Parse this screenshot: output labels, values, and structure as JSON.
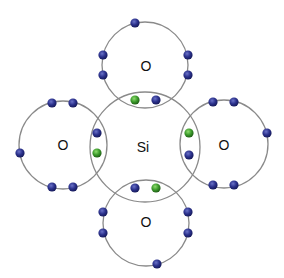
{
  "diagram": {
    "colors": {
      "shell_stroke": "#8a8a8a",
      "electron_oxygen": "#2b318c",
      "electron_silicon": "#3c9b2c",
      "background": "#ffffff"
    },
    "atoms": [
      {
        "id": "si",
        "label": "Si",
        "cx": 145,
        "cy": 147,
        "r": 55,
        "label_x": 143,
        "label_y": 147
      },
      {
        "id": "o-top",
        "label": "O",
        "cx": 145,
        "cy": 65,
        "r": 43,
        "label_x": 146,
        "label_y": 66
      },
      {
        "id": "o-left",
        "label": "O",
        "cx": 63,
        "cy": 145,
        "r": 44,
        "label_x": 63,
        "label_y": 145
      },
      {
        "id": "o-right",
        "label": "O",
        "cx": 224,
        "cy": 144,
        "r": 44,
        "label_x": 224,
        "label_y": 145
      },
      {
        "id": "o-bottom",
        "label": "O",
        "cx": 146,
        "cy": 223,
        "r": 43,
        "label_x": 146,
        "label_y": 222
      }
    ],
    "electrons": [
      {
        "owner": "o-top",
        "type": "oxygen",
        "x": 135,
        "y": 23
      },
      {
        "owner": "o-top",
        "type": "oxygen",
        "x": 103,
        "y": 55
      },
      {
        "owner": "o-top",
        "type": "oxygen",
        "x": 103,
        "y": 75
      },
      {
        "owner": "o-top",
        "type": "oxygen",
        "x": 188,
        "y": 55
      },
      {
        "owner": "o-top",
        "type": "oxygen",
        "x": 188,
        "y": 75
      },
      {
        "owner": "bond-top",
        "type": "silicon",
        "x": 135,
        "y": 100
      },
      {
        "owner": "bond-top",
        "type": "oxygen",
        "x": 156,
        "y": 100
      },
      {
        "owner": "o-left",
        "type": "oxygen",
        "x": 52,
        "y": 103
      },
      {
        "owner": "o-left",
        "type": "oxygen",
        "x": 73,
        "y": 103
      },
      {
        "owner": "o-left",
        "type": "oxygen",
        "x": 20,
        "y": 153
      },
      {
        "owner": "o-left",
        "type": "oxygen",
        "x": 52,
        "y": 187
      },
      {
        "owner": "o-left",
        "type": "oxygen",
        "x": 73,
        "y": 187
      },
      {
        "owner": "bond-left",
        "type": "oxygen",
        "x": 97,
        "y": 133
      },
      {
        "owner": "bond-left",
        "type": "silicon",
        "x": 97,
        "y": 153
      },
      {
        "owner": "o-right",
        "type": "oxygen",
        "x": 213,
        "y": 102
      },
      {
        "owner": "o-right",
        "type": "oxygen",
        "x": 234,
        "y": 102
      },
      {
        "owner": "o-right",
        "type": "oxygen",
        "x": 267,
        "y": 133
      },
      {
        "owner": "o-right",
        "type": "oxygen",
        "x": 213,
        "y": 185
      },
      {
        "owner": "o-right",
        "type": "oxygen",
        "x": 234,
        "y": 185
      },
      {
        "owner": "bond-right",
        "type": "silicon",
        "x": 189,
        "y": 133
      },
      {
        "owner": "bond-right",
        "type": "oxygen",
        "x": 189,
        "y": 155
      },
      {
        "owner": "bond-bottom",
        "type": "oxygen",
        "x": 135,
        "y": 188
      },
      {
        "owner": "bond-bottom",
        "type": "silicon",
        "x": 156,
        "y": 188
      },
      {
        "owner": "o-bottom",
        "type": "oxygen",
        "x": 103,
        "y": 212
      },
      {
        "owner": "o-bottom",
        "type": "oxygen",
        "x": 103,
        "y": 233
      },
      {
        "owner": "o-bottom",
        "type": "oxygen",
        "x": 188,
        "y": 212
      },
      {
        "owner": "o-bottom",
        "type": "oxygen",
        "x": 188,
        "y": 233
      },
      {
        "owner": "o-bottom",
        "type": "oxygen",
        "x": 157,
        "y": 264
      }
    ]
  }
}
